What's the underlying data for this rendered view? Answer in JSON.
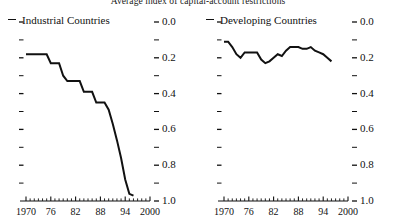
{
  "chart_title": "Average index of capital-account restrictions",
  "panels": [
    {
      "legend_label": "Industrial Countries",
      "legend_marker": "dash-marker",
      "y_labels": [
        "1.0",
        "0.8",
        "0.6",
        "0.4",
        "0.2",
        "0.0"
      ],
      "y_minor_ticks": [
        "0.9",
        "0.7",
        "0.5",
        "0.3",
        "0.1"
      ],
      "x_labels": [
        "1970",
        "76",
        "82",
        "88",
        "94",
        "2000"
      ]
    },
    {
      "legend_label": "Developing Countries",
      "legend_marker": "dash-marker",
      "y_labels": [
        "1.0",
        "0.8",
        "0.6",
        "0.4",
        "0.2",
        "0.0"
      ],
      "y_minor_ticks": [
        "0.9",
        "0.7",
        "0.5",
        "0.3",
        "0.1"
      ],
      "x_labels": [
        "1970",
        "76",
        "82",
        "88",
        "94",
        "2000"
      ]
    }
  ],
  "chart_data": {
    "type": "line",
    "title": "Average index of capital-account restrictions",
    "xlabel": "",
    "ylabel": "",
    "xlim": [
      1970,
      2000
    ],
    "ylim": [
      0.0,
      1.0
    ],
    "grid": false,
    "legend_position": "top-left of each panel",
    "x_ticks_major": [
      1970,
      1976,
      1982,
      1988,
      1994,
      2000
    ],
    "x_tick_labels": [
      "1970",
      "76",
      "82",
      "88",
      "94",
      "2000"
    ],
    "x_ticks_minor_step": 1,
    "y_ticks_major": [
      0.0,
      0.2,
      0.4,
      0.6,
      0.8,
      1.0
    ],
    "y_tick_labels": [
      "0.0",
      "0.2",
      "0.4",
      "0.6",
      "0.8",
      "1.0"
    ],
    "y_ticks_minor": [
      0.1,
      0.3,
      0.5,
      0.7,
      0.9
    ],
    "panels": [
      {
        "name": "Industrial Countries",
        "x": [
          1970,
          1971,
          1972,
          1973,
          1974,
          1975,
          1976,
          1977,
          1978,
          1979,
          1980,
          1981,
          1982,
          1983,
          1984,
          1985,
          1986,
          1987,
          1988,
          1989,
          1990,
          1991,
          1992,
          1993,
          1994,
          1995,
          1996
        ],
        "values": [
          0.82,
          0.82,
          0.82,
          0.82,
          0.82,
          0.82,
          0.77,
          0.77,
          0.77,
          0.7,
          0.67,
          0.67,
          0.67,
          0.67,
          0.61,
          0.61,
          0.61,
          0.55,
          0.55,
          0.55,
          0.51,
          0.43,
          0.34,
          0.24,
          0.12,
          0.04,
          0.03
        ]
      },
      {
        "name": "Developing Countries",
        "x": [
          1970,
          1971,
          1972,
          1973,
          1974,
          1975,
          1976,
          1977,
          1978,
          1979,
          1980,
          1981,
          1982,
          1983,
          1984,
          1985,
          1986,
          1987,
          1988,
          1989,
          1990,
          1991,
          1992,
          1993,
          1994,
          1995,
          1996
        ],
        "values": [
          0.89,
          0.89,
          0.86,
          0.82,
          0.8,
          0.83,
          0.83,
          0.83,
          0.83,
          0.79,
          0.77,
          0.78,
          0.8,
          0.82,
          0.81,
          0.84,
          0.86,
          0.86,
          0.86,
          0.85,
          0.85,
          0.86,
          0.84,
          0.83,
          0.82,
          0.8,
          0.78
        ]
      }
    ]
  }
}
